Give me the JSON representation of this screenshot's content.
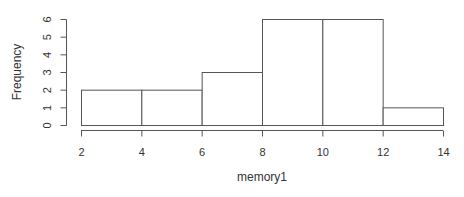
{
  "chart_data": {
    "type": "bar",
    "subtype": "histogram",
    "title": "",
    "xlabel": "memory1",
    "ylabel": "Frequency",
    "bin_edges": [
      2,
      4,
      6,
      8,
      10,
      12,
      14
    ],
    "categories": [
      "2-4",
      "4-6",
      "6-8",
      "8-10",
      "10-12",
      "12-14"
    ],
    "values": [
      2,
      2,
      3,
      6,
      6,
      1
    ],
    "xlim": [
      2,
      14
    ],
    "ylim": [
      0,
      6
    ],
    "x_ticks": [
      2,
      4,
      6,
      8,
      10,
      12,
      14
    ],
    "y_ticks": [
      0,
      1,
      2,
      3,
      4,
      5,
      6
    ],
    "grid": false,
    "legend": null,
    "colors": {
      "bar_fill": "#ffffff",
      "bar_stroke": "#555555",
      "axis": "#555555",
      "text": "#333333"
    }
  }
}
